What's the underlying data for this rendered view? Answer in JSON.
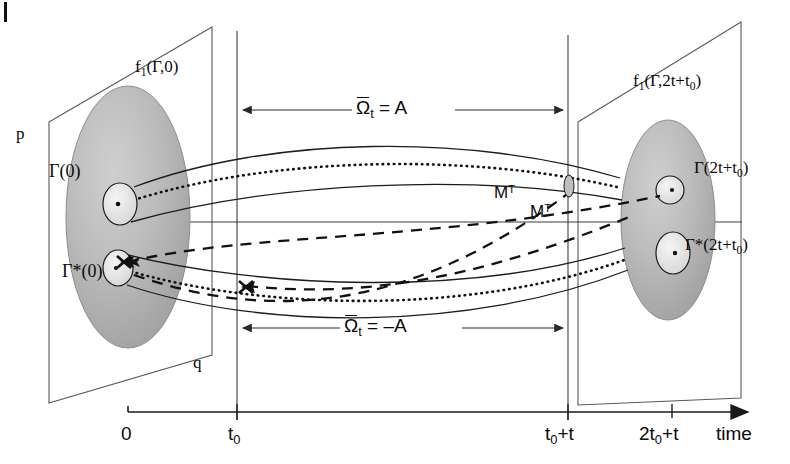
{
  "figure": {
    "kind": "phase-space-time-reversal-diagram",
    "background": "#ffffff",
    "ink": "#0a0a0a",
    "ellipse_fill_outer": "#b4b4b4",
    "ellipse_fill_inner": "#e6e6e6",
    "plane_stroke": "#5a5a5a"
  },
  "axes": {
    "p_label": "p",
    "q_label": "q",
    "time_label": "time",
    "ticks": [
      {
        "label_prefix": "0",
        "sub": "",
        "suffix": ""
      },
      {
        "label_prefix": "t",
        "sub": "0",
        "suffix": ""
      },
      {
        "label_prefix": "t",
        "sub": "0",
        "suffix": "+t"
      },
      {
        "label_prefix": "2t",
        "sub": "0",
        "suffix": "+t"
      }
    ]
  },
  "planes": {
    "left": {
      "name": "initial-distribution-plane",
      "label_prefix": "f",
      "label_sub": "1",
      "label_suffix": "(Γ,0)"
    },
    "right": {
      "name": "final-distribution-plane",
      "label_prefix": "f",
      "label_sub": "1",
      "label_suffix": "(Γ,2t+t",
      "label_sub2": "0",
      "label_tail": ")"
    }
  },
  "bundles": {
    "upper_left": {
      "label_prefix": "Γ(0)"
    },
    "lower_left": {
      "label_prefix": "Γ*(0)"
    },
    "upper_right": {
      "label_prefix": "Γ(2t+t",
      "label_sub": "0",
      "label_tail": ")"
    },
    "lower_right": {
      "label_prefix": "Γ*(2t+t",
      "label_sub": "0",
      "label_tail": ")"
    }
  },
  "measures": {
    "upper": {
      "symbol": "Ω",
      "sub": "t",
      "relation": "= A"
    },
    "lower": {
      "symbol": "Ω",
      "sub": "t",
      "relation": "= –A"
    }
  },
  "maps": [
    {
      "label": "M",
      "sup": "T"
    },
    {
      "label": "M",
      "sup": "T"
    }
  ]
}
